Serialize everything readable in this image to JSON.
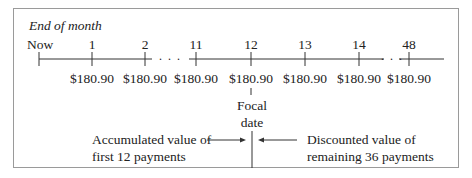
{
  "header": {
    "label": "End of month"
  },
  "timeline": {
    "ticks": [
      {
        "label": "Now",
        "x": 39,
        "payment": ""
      },
      {
        "label": "1",
        "x": 92,
        "payment": "$180.90"
      },
      {
        "label": "2",
        "x": 145,
        "payment": "$180.90"
      },
      {
        "label": "11",
        "x": 196,
        "payment": "$180.90"
      },
      {
        "label": "12",
        "x": 251,
        "payment": "$180.90"
      },
      {
        "label": "13",
        "x": 305,
        "payment": "$180.90"
      },
      {
        "label": "14",
        "x": 359,
        "payment": "$180.90"
      },
      {
        "label": "48",
        "x": 409,
        "payment": "$180.90"
      }
    ],
    "ellipsis": "· · ·"
  },
  "focal": {
    "line1": "Focal",
    "line2": "date"
  },
  "left_note": {
    "line1": "Accumulated value of",
    "line2": "first 12 payments"
  },
  "right_note": {
    "line1": "Discounted value of",
    "line2": "remaining 36 payments"
  }
}
